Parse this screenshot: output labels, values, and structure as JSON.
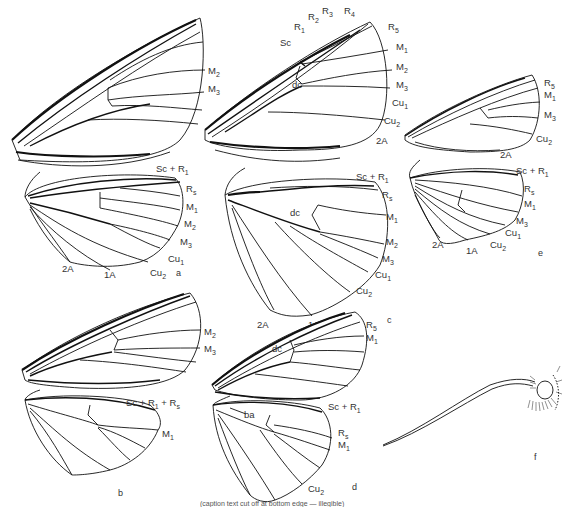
{
  "figure": {
    "panels": [
      {
        "id": "a",
        "letter": "a",
        "forewing_labels": [
          "M2",
          "M3"
        ],
        "hindwing_labels": [
          "Sc+R1",
          "Rs",
          "M1",
          "M2",
          "M3",
          "Cu1",
          "Cu2",
          "1A",
          "2A"
        ]
      },
      {
        "id": "c",
        "letter": "c",
        "forewing_labels": [
          "Sc",
          "R1",
          "R2",
          "R3",
          "R4",
          "R5",
          "M1",
          "M2",
          "M3",
          "Cu1",
          "Cu2",
          "2A",
          "dc"
        ],
        "hindwing_labels": [
          "Sc+R1",
          "Rs",
          "dc",
          "M1",
          "M2",
          "M3",
          "Cu1",
          "Cu2",
          "1A",
          "2A"
        ]
      },
      {
        "id": "e",
        "letter": "e",
        "forewing_labels": [
          "R5",
          "M1",
          "M3",
          "Cu2",
          "2A"
        ],
        "hindwing_labels": [
          "Sc+R1",
          "Rs",
          "M1",
          "M3",
          "Cu1",
          "Cu2",
          "1A",
          "2A"
        ]
      },
      {
        "id": "b",
        "letter": "b",
        "forewing_labels": [
          "M2",
          "M3"
        ],
        "hindwing_labels": [
          "Sc+R1+Rs",
          "M1"
        ]
      },
      {
        "id": "d",
        "letter": "d",
        "forewing_labels": [
          "R5",
          "M1",
          "dc"
        ],
        "hindwing_labels": [
          "Sc+R1",
          "ba",
          "Rs",
          "M1",
          "Cu2"
        ]
      },
      {
        "id": "f",
        "letter": "f",
        "description": "head with proboscis"
      }
    ],
    "caption": "(caption text cut off at bottom edge — illegible)"
  },
  "labels": {
    "a": {
      "fw_M2": "M",
      "fw_M2_sub": "2",
      "fw_M3": "M",
      "fw_M3_sub": "3",
      "hw_ScR1": "Sc + R",
      "hw_ScR1_sub": "1",
      "hw_Rs": "R",
      "hw_Rs_sub": "s",
      "hw_M1": "M",
      "hw_M1_sub": "1",
      "hw_M2": "M",
      "hw_M2_sub": "2",
      "hw_M3": "M",
      "hw_M3_sub": "3",
      "hw_Cu1": "Cu",
      "hw_Cu1_sub": "1",
      "hw_Cu2": "Cu",
      "hw_Cu2_sub": "2",
      "hw_1A": "1A",
      "hw_2A": "2A",
      "letter": "a"
    },
    "c": {
      "fw_Sc": "Sc",
      "fw_R1": "R",
      "fw_R1_sub": "1",
      "fw_R2": "R",
      "fw_R2_sub": "2",
      "fw_R3": "R",
      "fw_R3_sub": "3",
      "fw_R4": "R",
      "fw_R4_sub": "4",
      "fw_R5": "R",
      "fw_R5_sub": "5",
      "fw_M1": "M",
      "fw_M1_sub": "1",
      "fw_M2": "M",
      "fw_M2_sub": "2",
      "fw_M3": "M",
      "fw_M3_sub": "3",
      "fw_Cu1": "Cu",
      "fw_Cu1_sub": "1",
      "fw_Cu2": "Cu",
      "fw_Cu2_sub": "2",
      "fw_2A": "2A",
      "fw_dc": "dc",
      "hw_ScR1": "Sc + R",
      "hw_ScR1_sub": "1",
      "hw_Rs": "R",
      "hw_Rs_sub": "s",
      "hw_dc": "dc",
      "hw_M1": "M",
      "hw_M1_sub": "1",
      "hw_M2": "M",
      "hw_M2_sub": "2",
      "hw_M3": "M",
      "hw_M3_sub": "3",
      "hw_Cu1": "Cu",
      "hw_Cu1_sub": "1",
      "hw_Cu2": "Cu",
      "hw_Cu2_sub": "2",
      "hw_1A": "1A",
      "hw_2A": "2A",
      "letter": "c"
    },
    "e": {
      "fw_R5": "R",
      "fw_R5_sub": "5",
      "fw_M1": "M",
      "fw_M1_sub": "1",
      "fw_M3": "M",
      "fw_M3_sub": "3",
      "fw_Cu2": "Cu",
      "fw_Cu2_sub": "2",
      "fw_2A": "2A",
      "hw_ScR1": "Sc + R",
      "hw_ScR1_sub": "1",
      "hw_Rs": "R",
      "hw_Rs_sub": "s",
      "hw_M1": "M",
      "hw_M1_sub": "1",
      "hw_M3": "M",
      "hw_M3_sub": "3",
      "hw_Cu1": "Cu",
      "hw_Cu1_sub": "1",
      "hw_Cu2": "Cu",
      "hw_Cu2_sub": "2",
      "hw_1A": "1A",
      "hw_2A": "2A",
      "letter": "e"
    },
    "b": {
      "fw_M2": "M",
      "fw_M2_sub": "2",
      "fw_M3": "M",
      "fw_M3_sub": "3",
      "hw_ScR1Rs": "Sc + R",
      "hw_ScR1Rs_sub1": "1",
      "hw_ScR1Rs_mid": " + R",
      "hw_ScR1Rs_sub2": "s",
      "hw_M1": "M",
      "hw_M1_sub": "1",
      "letter": "b"
    },
    "d": {
      "fw_R5": "R",
      "fw_R5_sub": "5",
      "fw_M1": "M",
      "fw_M1_sub": "1",
      "fw_dc": "dc",
      "hw_ScR1": "Sc + R",
      "hw_ScR1_sub": "1",
      "hw_ba": "ba",
      "hw_Rs": "R",
      "hw_Rs_sub": "s",
      "hw_M1": "M",
      "hw_M1_sub": "1",
      "hw_Cu2": "Cu",
      "hw_Cu2_sub": "2",
      "letter": "d"
    },
    "f": {
      "letter": "f"
    }
  },
  "colors": {
    "line": "#111111",
    "text": "#333333",
    "background": "#ffffff"
  }
}
